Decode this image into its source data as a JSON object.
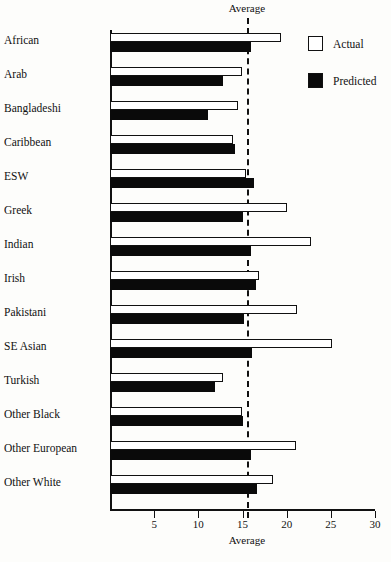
{
  "chart_data": {
    "type": "bar",
    "orientation": "horizontal",
    "title": "",
    "xlabel": "",
    "ylabel": "",
    "xlim": [
      0,
      30
    ],
    "grid": false,
    "categories": [
      "African",
      "Arab",
      "Bangladeshi",
      "Caribbean",
      "ESW",
      "Greek",
      "Indian",
      "Irish",
      "Pakistani",
      "SE Asian",
      "Turkish",
      "Other Black",
      "Other European",
      "Other White"
    ],
    "series": [
      {
        "name": "Actual",
        "color": "#ffffff",
        "values": [
          19.4,
          14.9,
          14.5,
          13.9,
          15.4,
          20.0,
          22.7,
          16.9,
          21.2,
          25.1,
          12.8,
          14.9,
          21.1,
          18.5
        ]
      },
      {
        "name": "Predicted",
        "color": "#0a0a0a",
        "values": [
          16.0,
          12.8,
          11.1,
          14.1,
          16.3,
          15.0,
          16.0,
          16.5,
          15.2,
          16.1,
          11.9,
          15.0,
          16.0,
          16.6
        ]
      }
    ],
    "xticks": [
      5,
      10,
      15,
      20,
      25,
      30
    ],
    "xticklabels": [
      "5",
      "10",
      "15",
      "20",
      "25",
      "30"
    ],
    "annotations": {
      "average_line_value": 15.5,
      "average_label_top": "Average",
      "average_label_bottom": "Average"
    },
    "legend": {
      "position": "top-right",
      "entries": [
        {
          "label": "Actual",
          "swatch": "white-square"
        },
        {
          "label": "Predicted",
          "swatch": "black-square"
        }
      ]
    }
  }
}
